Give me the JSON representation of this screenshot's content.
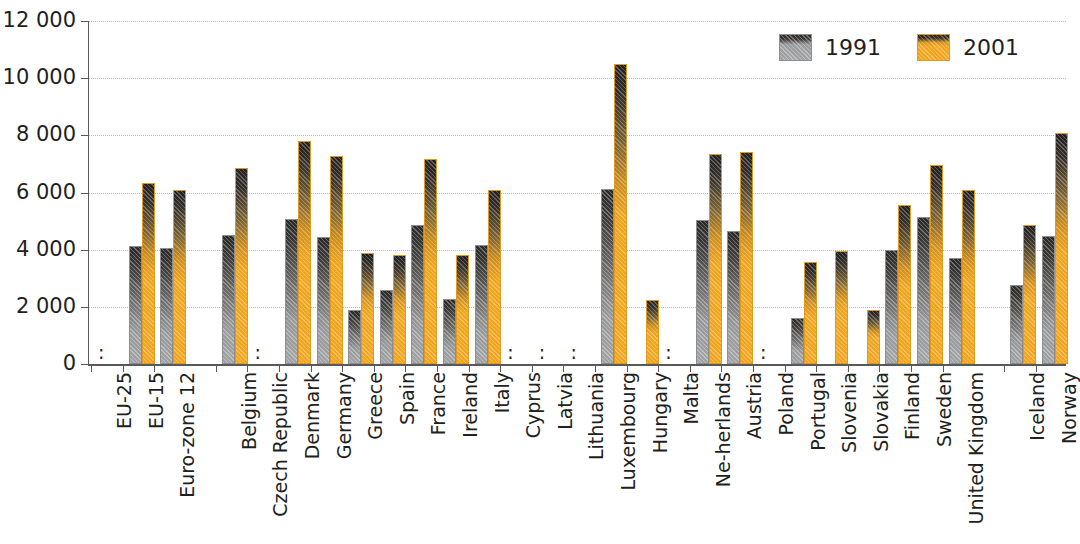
{
  "chart_data": {
    "type": "bar",
    "title": "",
    "subtitle": "",
    "xlabel": "",
    "ylabel": "",
    "ylim": [
      0,
      12000
    ],
    "yticks": [
      0,
      2000,
      4000,
      6000,
      8000,
      10000,
      12000
    ],
    "ytick_labels": [
      "0",
      "2 000",
      "4 000",
      "6 000",
      "8 000",
      "10 000",
      "12 000"
    ],
    "grid": true,
    "legend_position": "top-right",
    "no_data_marker": ":",
    "categories": [
      "EU-25",
      "EU-15",
      "Euro-zone 12",
      "Belgium",
      "Czech Republic",
      "Denmark",
      "Germany",
      "Greece",
      "Spain",
      "France",
      "Ireland",
      "Italy",
      "Cyprus",
      "Latvia",
      "Lithuania",
      "Luxembourg",
      "Hungary",
      "Malta",
      "Ne-herlands",
      "Austria",
      "Poland",
      "Portugal",
      "Slovenia",
      "Slovakia",
      "Finland",
      "Sweden",
      "United Kingdom",
      "Iceland",
      "Norway"
    ],
    "series": [
      {
        "name": "1991",
        "color": "#9a9b9d",
        "values": [
          null,
          4120,
          4070,
          4500,
          null,
          5070,
          4440,
          1900,
          2580,
          4880,
          2270,
          4180,
          null,
          null,
          null,
          6130,
          null,
          null,
          5050,
          4650,
          null,
          1620,
          null,
          null,
          3980,
          5150,
          3720,
          2780,
          4480
        ]
      },
      {
        "name": "2001",
        "color": "#f0a621",
        "values": [
          null,
          6350,
          6100,
          6850,
          null,
          7800,
          7280,
          3900,
          3820,
          7180,
          3830,
          6100,
          null,
          null,
          null,
          10500,
          2250,
          null,
          7330,
          7400,
          null,
          3580,
          3950,
          1900,
          5550,
          6960,
          6090,
          4870,
          8090
        ]
      }
    ],
    "group_gaps_after": [
      "Euro-zone 12",
      "United Kingdom"
    ]
  },
  "legend": {
    "items": [
      {
        "label": "1991",
        "swatch": "gray-swatch"
      },
      {
        "label": "2001",
        "swatch": "orange-swatch"
      }
    ]
  }
}
